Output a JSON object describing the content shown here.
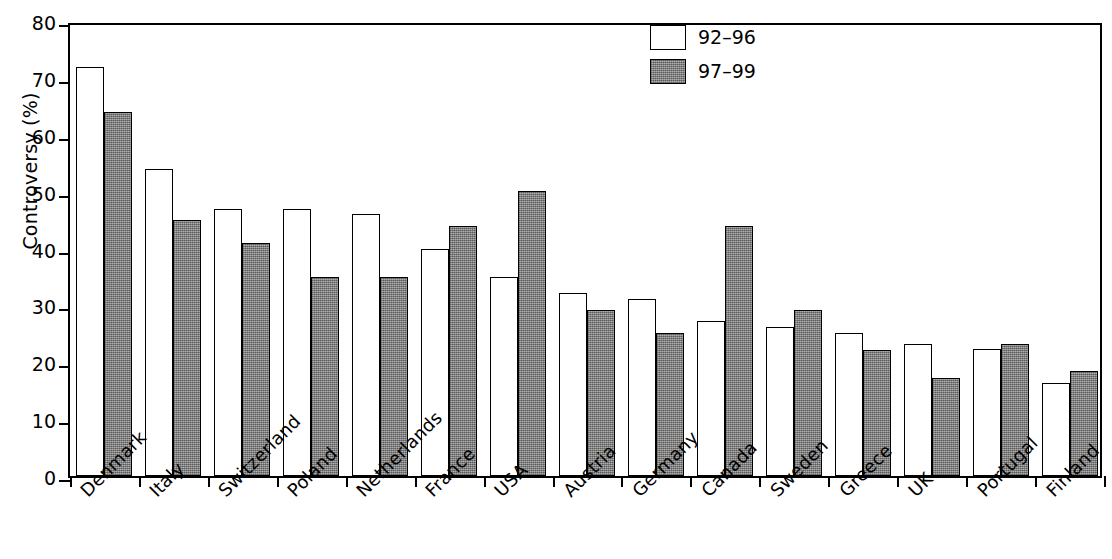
{
  "chart_data": {
    "type": "bar",
    "title": "",
    "xlabel": "",
    "ylabel": "Controversy (%)",
    "ylim": [
      0,
      80
    ],
    "yticks": [
      0,
      10,
      20,
      30,
      40,
      50,
      60,
      70,
      80
    ],
    "ytick_labels": [
      "0",
      "10",
      "20",
      "30",
      "40",
      "50",
      "60",
      "70",
      "80"
    ],
    "grid": false,
    "legend_position": "top-right",
    "categories": [
      "Denmark",
      "Italy",
      "Switzerland",
      "Poland",
      "Netherlands",
      "France",
      "USA",
      "Austria",
      "Germany",
      "Canada",
      "Sweden",
      "Greece",
      "UK",
      "Portugal",
      "Finland"
    ],
    "series": [
      {
        "name": "92–96",
        "color": "#ffffff",
        "values": [
          72.0,
          54.0,
          47.0,
          47.0,
          46.0,
          40.0,
          35.0,
          32.2,
          31.2,
          27.2,
          26.2,
          25.2,
          23.2,
          22.3,
          16.4
        ]
      },
      {
        "name": "97–99",
        "color": "#8a8a8a",
        "values": [
          64.0,
          45.0,
          41.0,
          35.0,
          35.0,
          44.0,
          50.1,
          29.2,
          25.2,
          44.0,
          29.2,
          22.2,
          17.3,
          23.2,
          18.5
        ]
      }
    ]
  },
  "legend": {
    "items": [
      {
        "label": "92–96",
        "swatch": "light"
      },
      {
        "label": "97–99",
        "swatch": "dark"
      }
    ]
  },
  "axes": {
    "y_title": "Controversy (%)"
  }
}
